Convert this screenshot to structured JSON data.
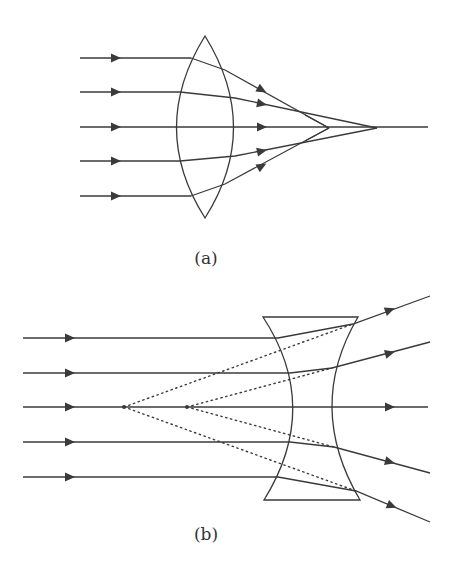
{
  "figure": {
    "panels": [
      {
        "id": "a",
        "label": "(a)",
        "lens_type": "convex (converging) lens",
        "incident_rays": 5,
        "description": "Parallel rays refracted by a convex lens converge; marginal rays focus closer than paraxial rays (spherical aberration)"
      },
      {
        "id": "b",
        "label": "(b)",
        "lens_type": "concave (diverging) lens",
        "incident_rays": 5,
        "description": "Parallel rays diverge after a concave lens; dotted back-extensions meet at two virtual focal points on the axis"
      }
    ],
    "colors": {
      "line": "#3a3a3a",
      "background": "#ffffff"
    }
  }
}
